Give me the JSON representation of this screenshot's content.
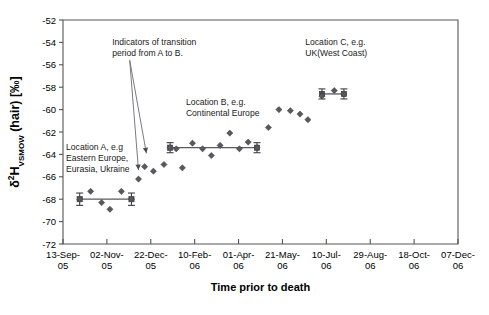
{
  "chart_data": {
    "type": "scatter",
    "title": "",
    "xlabel": "Time prior to death",
    "ylabel_parts": {
      "delta": "δ",
      "superscript": "2",
      "element": "H",
      "subscript": "VSMOW",
      "rest": " (hair) [‰]"
    },
    "ylabel": "δ2HVSMOW (hair) [‰]",
    "ylim": [
      -72,
      -52
    ],
    "yticks": [
      "-52",
      "-54",
      "-56",
      "-58",
      "-60",
      "-62",
      "-64",
      "-66",
      "-68",
      "-70",
      "-72"
    ],
    "ytick_values": [
      -52,
      -54,
      -56,
      -58,
      -60,
      -62,
      -64,
      -66,
      -68,
      -70,
      -72
    ],
    "xticks": [
      "13-Sep-\n05",
      "02-Nov-\n05",
      "22-Dec-\n05",
      "10-Feb-\n06",
      "01-Apr-\n06",
      "21-May-\n06",
      "10-Jul-\n06",
      "29-Aug-\n06",
      "18-Oct-\n06",
      "07-Dec-\n06"
    ],
    "xtick_labels": [
      {
        "line1": "13-Sep-",
        "line2": "05"
      },
      {
        "line1": "02-Nov-",
        "line2": "05"
      },
      {
        "line1": "22-Dec-",
        "line2": "05"
      },
      {
        "line1": "10-Feb-",
        "line2": "06"
      },
      {
        "line1": "01-Apr-",
        "line2": "06"
      },
      {
        "line1": "21-May-",
        "line2": "06"
      },
      {
        "line1": "10-Jul-",
        "line2": "06"
      },
      {
        "line1": "29-Aug-",
        "line2": "06"
      },
      {
        "line1": "18-Oct-",
        "line2": "06"
      },
      {
        "line1": "07-Dec-",
        "line2": "06"
      }
    ],
    "xlim_index": [
      0,
      9
    ],
    "grid": false,
    "legend": "none",
    "series": [
      {
        "name": "Hair δ2H measurements",
        "marker": "diamond",
        "points": [
          {
            "x": 0.38,
            "y": -68.0
          },
          {
            "x": 0.63,
            "y": -67.3
          },
          {
            "x": 0.88,
            "y": -68.3
          },
          {
            "x": 1.07,
            "y": -68.9
          },
          {
            "x": 1.33,
            "y": -67.3
          },
          {
            "x": 1.56,
            "y": -68.0
          },
          {
            "x": 1.72,
            "y": -66.2
          },
          {
            "x": 1.86,
            "y": -65.1
          },
          {
            "x": 2.06,
            "y": -65.5
          },
          {
            "x": 2.3,
            "y": -64.9
          },
          {
            "x": 2.44,
            "y": -63.4
          },
          {
            "x": 2.58,
            "y": -63.5
          },
          {
            "x": 2.72,
            "y": -65.2
          },
          {
            "x": 2.95,
            "y": -63.0
          },
          {
            "x": 3.18,
            "y": -63.5
          },
          {
            "x": 3.38,
            "y": -64.1
          },
          {
            "x": 3.58,
            "y": -63.2
          },
          {
            "x": 3.8,
            "y": -62.1
          },
          {
            "x": 4.02,
            "y": -63.5
          },
          {
            "x": 4.22,
            "y": -62.9
          },
          {
            "x": 4.42,
            "y": -63.4
          },
          {
            "x": 4.68,
            "y": -61.6
          },
          {
            "x": 4.92,
            "y": -60.0
          },
          {
            "x": 5.18,
            "y": -60.1
          },
          {
            "x": 5.4,
            "y": -60.4
          },
          {
            "x": 5.58,
            "y": -60.9
          },
          {
            "x": 5.9,
            "y": -58.8
          },
          {
            "x": 6.18,
            "y": -58.3
          },
          {
            "x": 6.4,
            "y": -58.6
          }
        ]
      }
    ],
    "mean_segments": [
      {
        "label": "Location A mean",
        "x_start": 0.38,
        "x_end": 1.56,
        "y": -68.0,
        "error": 0.55,
        "endpoints": [
          {
            "x": 0.38,
            "y": -68.0,
            "error": 0.55
          },
          {
            "x": 1.56,
            "y": -68.0,
            "error": 0.55
          }
        ]
      },
      {
        "label": "Location B mean",
        "x_start": 2.44,
        "x_end": 4.42,
        "y": -63.4,
        "error": 0.45,
        "endpoints": [
          {
            "x": 2.44,
            "y": -63.4,
            "error": 0.45
          },
          {
            "x": 4.42,
            "y": -63.4,
            "error": 0.45
          }
        ]
      },
      {
        "label": "Location C mean",
        "x_start": 5.9,
        "x_end": 6.4,
        "y": -58.6,
        "error": 0.45,
        "endpoints": [
          {
            "x": 5.9,
            "y": -58.6,
            "error": 0.45
          },
          {
            "x": 6.4,
            "y": -58.6,
            "error": 0.45
          }
        ]
      }
    ],
    "annotations": [
      {
        "id": "transition",
        "lines": [
          "Indicators of transition",
          "period from A to B."
        ],
        "text_x": 1.12,
        "text_y": -54.2,
        "arrows": [
          {
            "from_x": 1.52,
            "from_y": -55.6,
            "to_x": 1.72,
            "to_y": -65.4
          },
          {
            "from_x": 1.52,
            "from_y": -55.6,
            "to_x": 1.9,
            "to_y": -63.9
          }
        ]
      },
      {
        "id": "location-a",
        "lines": [
          "Location A, e.g",
          "Eastern Europe,",
          "Eurasia, Ukraine"
        ],
        "text_x": 0.07,
        "text_y": -63.6
      },
      {
        "id": "location-b",
        "lines": [
          "Location B, e.g.",
          "Continental Europe"
        ],
        "text_x": 2.8,
        "text_y": -59.6
      },
      {
        "id": "location-c",
        "lines": [
          "Location C, e.g.",
          "UK(West Coast)"
        ],
        "text_x": 5.52,
        "text_y": -54.2
      }
    ],
    "colors": {
      "marker": "#58585f",
      "mean_line": "#5a5a62",
      "axis": "#555555",
      "text": "#000000",
      "background": "#ffffff"
    }
  }
}
